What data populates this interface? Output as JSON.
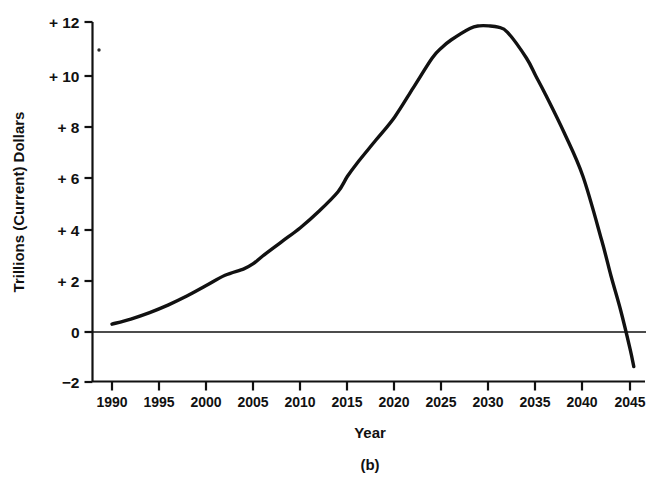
{
  "chart_data": {
    "type": "line",
    "title": "",
    "caption": "(b)",
    "xlabel": "Year",
    "ylabel": "Trillions (Current) Dollars",
    "xlim": [
      1988,
      2046
    ],
    "ylim": [
      -2,
      12
    ],
    "grid": false,
    "legend": "none",
    "x_tick_labels": [
      "1990",
      "1995",
      "2000",
      "2005",
      "2010",
      "2015",
      "2020",
      "2025",
      "2030",
      "2035",
      "2040",
      "2045"
    ],
    "x_ticks": [
      1990,
      1995,
      2000,
      2005,
      2010,
      2015,
      2020,
      2025,
      2030,
      2035,
      2040,
      2045
    ],
    "y_tick_labels": [
      "+12",
      "+10",
      "+8",
      "+6",
      "+4",
      "+2",
      "0",
      "-2"
    ],
    "y_ticks": [
      12,
      10,
      8,
      6,
      4,
      2,
      0,
      -2
    ],
    "zero_line": 0,
    "series": [
      {
        "name": "Projected balance",
        "x": [
          1990,
          1992,
          1994,
          1996,
          1998,
          2000,
          2002,
          2004,
          2005,
          2006,
          2008,
          2010,
          2012,
          2014,
          2015,
          2016,
          2018,
          2020,
          2022,
          2024,
          2025,
          2026,
          2028,
          2029,
          2030,
          2031,
          2032,
          2034,
          2035,
          2036,
          2038,
          2040,
          2042,
          2043,
          2044,
          2045,
          2045.4
        ],
        "y": [
          0.25,
          0.45,
          0.7,
          1.0,
          1.35,
          1.75,
          2.15,
          2.4,
          2.6,
          2.9,
          3.45,
          4.0,
          4.65,
          5.4,
          6.0,
          6.5,
          7.4,
          8.3,
          9.45,
          10.6,
          11.0,
          11.3,
          11.75,
          11.85,
          11.85,
          11.8,
          11.6,
          10.6,
          9.9,
          9.2,
          7.7,
          6.0,
          3.5,
          2.1,
          0.8,
          -0.7,
          -1.4
        ]
      }
    ]
  },
  "axis": {
    "y_label": "Trillions (Current) Dollars",
    "x_label": "Year"
  },
  "figure": {
    "caption": "(b)"
  }
}
